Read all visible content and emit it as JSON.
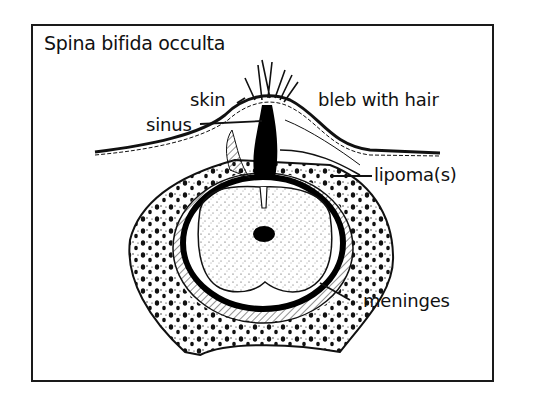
{
  "figure": {
    "title": "Spina bifida occulta",
    "labels": {
      "skin": "skin",
      "sinus": "sinus",
      "bleb": "bleb with hair",
      "lipoma": "lipoma(s)",
      "meninges": "meninges"
    }
  }
}
